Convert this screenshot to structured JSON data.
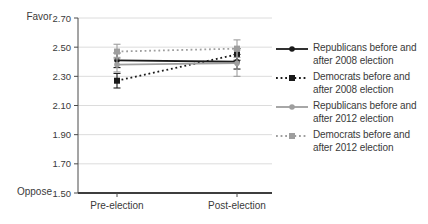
{
  "chart_data": {
    "type": "line",
    "title": "",
    "x_categories": [
      "Pre-election",
      "Post-election"
    ],
    "y_axis": {
      "min": 1.5,
      "max": 2.7,
      "ticks": [
        "2.70",
        "2.50",
        "2.30",
        "2.10",
        "1.90",
        "1.70",
        "1.50"
      ],
      "top_label": "Favor",
      "bottom_label": "Oppose"
    },
    "grid": true,
    "legend_position": "right",
    "colors": {
      "black_series": "#1a1a1a",
      "gray_series": "#9e9e9e",
      "gridline": "#dcdcdc",
      "axis": "#4a4a4a"
    },
    "series": [
      {
        "name": "Republicans before and after 2008 election",
        "legend_lines": [
          "Republicans before and",
          "after 2008 election"
        ],
        "color": "#1a1a1a",
        "line_style": "solid",
        "marker": "circle",
        "values": [
          2.41,
          2.4
        ],
        "ci": [
          0.05,
          0.05
        ]
      },
      {
        "name": "Democrats before and after 2008 election",
        "legend_lines": [
          "Democrats before and",
          "after 2008 election"
        ],
        "color": "#1a1a1a",
        "line_style": "dotted",
        "marker": "square",
        "values": [
          2.27,
          2.45
        ],
        "ci": [
          0.05,
          0.04
        ]
      },
      {
        "name": "Republicans before and after 2012 election",
        "legend_lines": [
          "Republicans before and",
          "after 2012 election"
        ],
        "color": "#9e9e9e",
        "line_style": "solid",
        "marker": "circle",
        "values": [
          2.38,
          2.39
        ],
        "ci": [
          0.05,
          0.09
        ]
      },
      {
        "name": "Democrats before and after 2012 election",
        "legend_lines": [
          "Democrats before and",
          "after 2012 election"
        ],
        "color": "#9e9e9e",
        "line_style": "dotted",
        "marker": "square",
        "values": [
          2.47,
          2.49
        ],
        "ci": [
          0.05,
          0.06
        ]
      }
    ]
  }
}
